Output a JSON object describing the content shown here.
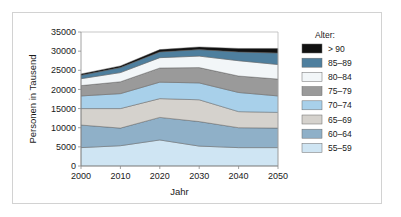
{
  "chart_data": {
    "type": "area",
    "title": "",
    "xlabel": "Jahr",
    "ylabel": "Personen in Tausend",
    "x": [
      2000,
      2010,
      2020,
      2030,
      2040,
      2050
    ],
    "xlim": [
      2000,
      2050
    ],
    "ylim": [
      0,
      35000
    ],
    "xticks": [
      "2000",
      "2010",
      "2020",
      "2030",
      "2040",
      "2050"
    ],
    "yticks": [
      "0",
      "5000",
      "10000",
      "15000",
      "20000",
      "25000",
      "30000",
      "35000"
    ],
    "ytick_values": [
      0,
      5000,
      10000,
      15000,
      20000,
      25000,
      30000,
      35000
    ],
    "grid": false,
    "legend_position": "right",
    "legend_title": "Alter:",
    "stacked": true,
    "stack_order_bottom_to_top": [
      "55-59",
      "60-64",
      "65-69",
      "70-74",
      "75-79",
      "80-84",
      "85-89",
      "> 90"
    ],
    "series": [
      {
        "name": "55–59",
        "color": "#cfe5f3",
        "values": [
          4800,
          5300,
          6800,
          5200,
          4800,
          4800
        ]
      },
      {
        "name": "60–64",
        "color": "#8fb0c8",
        "values": [
          5900,
          4600,
          5900,
          6400,
          5200,
          5100
        ]
      },
      {
        "name": "65–69",
        "color": "#d5d2cd",
        "values": [
          4300,
          5100,
          4900,
          5700,
          4200,
          4100
        ]
      },
      {
        "name": "70–74",
        "color": "#a8d0ea",
        "values": [
          3300,
          3900,
          4300,
          4400,
          5000,
          4300
        ]
      },
      {
        "name": "75–79",
        "color": "#9a9a9a",
        "values": [
          2700,
          3100,
          3700,
          4000,
          4300,
          4400
        ]
      },
      {
        "name": "80–84",
        "color": "#f2f6f8",
        "values": [
          1800,
          2400,
          2700,
          3000,
          4000,
          3800
        ]
      },
      {
        "name": "85–89",
        "color": "#4e7f9e",
        "values": [
          900,
          1300,
          1500,
          1700,
          2300,
          3000
        ]
      },
      {
        "name": "> 90",
        "color": "#111111",
        "values": [
          350,
          450,
          600,
          700,
          900,
          1200
        ]
      }
    ],
    "legend_entries": [
      {
        "label": "> 90",
        "color": "#111111"
      },
      {
        "label": "85–89",
        "color": "#4e7f9e"
      },
      {
        "label": "80–84",
        "color": "#f2f6f8"
      },
      {
        "label": "75–79",
        "color": "#9a9a9a"
      },
      {
        "label": "70–74",
        "color": "#a8d0ea"
      },
      {
        "label": "65–69",
        "color": "#d5d2cd"
      },
      {
        "label": "60–64",
        "color": "#8fb0c8"
      },
      {
        "label": "55–59",
        "color": "#cfe5f3"
      }
    ]
  }
}
